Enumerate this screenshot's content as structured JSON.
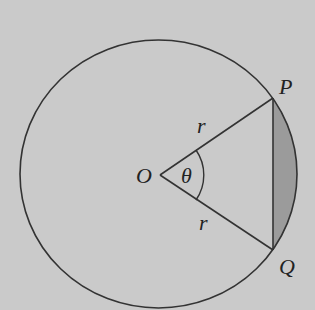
{
  "diagram": {
    "type": "circle-sector-segment",
    "background_color": "#cacaca",
    "stroke_color": "#333333",
    "segment_fill_color": "#9b9b9b",
    "labels": {
      "center": "O",
      "point_p": "P",
      "point_q": "Q",
      "radius_upper": "r",
      "radius_lower": "r",
      "angle": "θ"
    }
  }
}
